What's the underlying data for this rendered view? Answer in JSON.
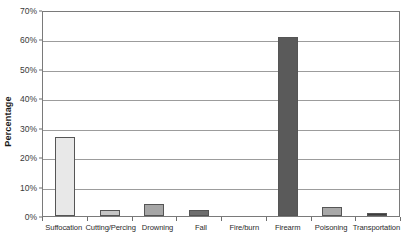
{
  "chart_data": {
    "type": "bar",
    "title": "",
    "xlabel": "",
    "ylabel": "Percentage",
    "ylim": [
      0,
      70
    ],
    "ytick_values": [
      0,
      10,
      20,
      30,
      40,
      50,
      60,
      70
    ],
    "ytick_labels": [
      "0%",
      "10%",
      "20%",
      "30%",
      "40%",
      "50%",
      "60%",
      "70%"
    ],
    "grid": "horizontal",
    "legend": "none",
    "categories": [
      "Suffocation",
      "Cutting/Percing",
      "Drowning",
      "Fall",
      "Fire/burn",
      "Firearm",
      "Poisoning",
      "Transportation"
    ],
    "values": [
      27,
      2,
      4,
      2,
      0,
      61,
      3,
      1
    ],
    "value_labels": [
      "27%",
      "2%",
      "4%",
      "2%",
      "0%",
      "61%",
      "3%",
      "1%"
    ],
    "bar_colors": [
      "#e8e8e8",
      "#c6c6c6",
      "#a6a6a6",
      "#6e6e6e",
      "#bdbdbd",
      "#5a5a5a",
      "#a8a8a8",
      "#3d3d3d"
    ]
  },
  "axis": {
    "plot_border_color": "#7a7a7a",
    "gridline_color": "#9c9c9c",
    "tick_color": "#6f6f6f"
  }
}
